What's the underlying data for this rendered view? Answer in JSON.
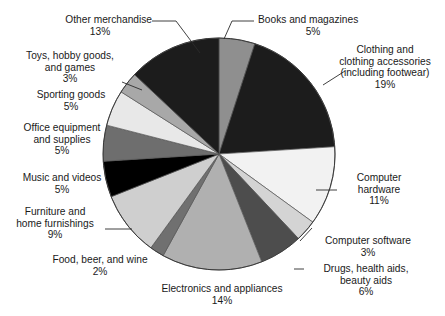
{
  "chart_data": {
    "type": "pie",
    "title": "",
    "subtitle": "",
    "xlabel": "",
    "ylabel": "",
    "legend_position": "callout-labels",
    "grid": false,
    "units": "percent",
    "start_angle_deg": 0,
    "direction": "clockwise",
    "categories": [
      "Books and magazines",
      "Clothing and clothing accessories (including footwear)",
      "Computer hardware",
      "Computer software",
      "Drugs, health aids, beauty aids",
      "Electronics and appliances",
      "Food, beer, and wine",
      "Furniture and home furnishings",
      "Music and videos",
      "Office equipment and supplies",
      "Sporting goods",
      "Toys, hobby goods, and games",
      "Other merchandise"
    ],
    "values": [
      5,
      19,
      11,
      3,
      6,
      14,
      2,
      9,
      5,
      5,
      5,
      3,
      13
    ],
    "slices": [
      {
        "name": "Books and magazines",
        "value": 5,
        "label": "5%",
        "color": "#8f8f8f"
      },
      {
        "name": "Clothing and clothing accessories (including footwear)",
        "value": 19,
        "label": "19%",
        "color": "#1c1c1c"
      },
      {
        "name": "Computer hardware",
        "value": 11,
        "label": "11%",
        "color": "#f2f2f2"
      },
      {
        "name": "Computer software",
        "value": 3,
        "label": "3%",
        "color": "#d4d4d4"
      },
      {
        "name": "Drugs, health aids, beauty aids",
        "value": 6,
        "label": "6%",
        "color": "#4d4d4d"
      },
      {
        "name": "Electronics and appliances",
        "value": 14,
        "label": "14%",
        "color": "#b0b0b0"
      },
      {
        "name": "Food, beer, and wine",
        "value": 2,
        "label": "2%",
        "color": "#707070"
      },
      {
        "name": "Furniture and home furnishings",
        "value": 9,
        "label": "9%",
        "color": "#cfcfcf"
      },
      {
        "name": "Music and videos",
        "value": 5,
        "label": "5%",
        "color": "#000000"
      },
      {
        "name": "Office equipment and supplies",
        "value": 5,
        "label": "5%",
        "color": "#6e6e6e"
      },
      {
        "name": "Sporting goods",
        "value": 5,
        "label": "5%",
        "color": "#e8e8e8"
      },
      {
        "name": "Toys, hobby goods, and games",
        "value": 3,
        "label": "3%",
        "color": "#a8a8a8"
      },
      {
        "name": "Other merchandise",
        "value": 13,
        "label": "13%",
        "color": "#1c1c1c"
      }
    ]
  },
  "labels": {
    "other_merchandise": {
      "line1": "Other merchandise",
      "pct": "13%"
    },
    "toys_hobby": {
      "line1": "Toys, hobby goods,",
      "line2": "and games",
      "pct": "3%"
    },
    "sporting_goods": {
      "line1": "Sporting goods",
      "pct": "5%"
    },
    "office_equipment": {
      "line1": "Office equipment",
      "line2": "and supplies",
      "pct": "5%"
    },
    "music_videos": {
      "line1": "Music and videos",
      "pct": "5%"
    },
    "furniture": {
      "line1": "Furniture and",
      "line2": "home furnishings",
      "pct": "9%"
    },
    "food_beer_wine": {
      "line1": "Food, beer, and wine",
      "pct": "2%"
    },
    "electronics": {
      "line1": "Electronics and appliances",
      "pct": "14%"
    },
    "drugs_health": {
      "line1": "Drugs, health aids,",
      "line2": "beauty aids",
      "pct": "6%"
    },
    "computer_software": {
      "line1": "Computer software",
      "pct": "3%"
    },
    "computer_hardware": {
      "line1": "Computer",
      "line2": "hardware",
      "pct": "11%"
    },
    "clothing": {
      "line1": "Clothing and",
      "line2": "clothing accessories",
      "line3": "(including footwear)",
      "pct": "19%"
    },
    "books_magazines": {
      "line1": "Books and magazines",
      "pct": "5%"
    }
  },
  "colors": {
    "background": "#ffffff",
    "text": "#1a1a1a",
    "leader_line": "#2b2b2b",
    "slice_outline": "#555555"
  }
}
